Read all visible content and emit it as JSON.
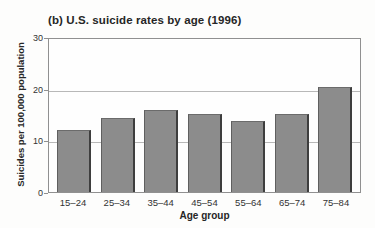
{
  "figure": {
    "title": "(b) U.S. suicide rates by age (1996)"
  },
  "chart_data": {
    "type": "bar",
    "title": "(b) U.S. suicide rates by age (1996)",
    "categories": [
      "15–24",
      "25–34",
      "35–44",
      "45–54",
      "55–64",
      "65–74",
      "75–84"
    ],
    "values": [
      12.0,
      14.3,
      15.8,
      15.1,
      13.8,
      15.1,
      20.3
    ],
    "xlabel": "Age group",
    "ylabel": "Suicides per 100,000 population",
    "ylim": [
      0,
      30
    ],
    "yticks": [
      30,
      20,
      10,
      0
    ],
    "gridlines": [
      20,
      10
    ],
    "grid": "horizontal",
    "legend": "none",
    "colors": {
      "bar_fill": "#8c8c8c",
      "bar_edge_dark": "#3e3e3e",
      "bar_edge_light": "#6b6b6b",
      "gridline": "#b8b8b8",
      "frame": "#909090",
      "text": "#262626"
    }
  }
}
